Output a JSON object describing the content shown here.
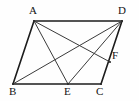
{
  "figure": {
    "kind": "geometry-diagram",
    "shape_name": "parallelogram",
    "canvas": {
      "width": 139,
      "height": 101,
      "background": "#fefefe"
    },
    "stroke_color": "#2b2b2b",
    "label_color": "#141414",
    "points": [
      {
        "id": "A",
        "label": "A",
        "x": 34,
        "y": 21,
        "label_x": 29,
        "label_y": 5,
        "role": "vertex"
      },
      {
        "id": "D",
        "label": "D",
        "x": 122,
        "y": 21,
        "label_x": 118,
        "label_y": 5,
        "role": "vertex"
      },
      {
        "id": "B",
        "label": "B",
        "x": 13,
        "y": 84,
        "label_x": 9,
        "label_y": 86,
        "role": "vertex"
      },
      {
        "id": "C",
        "label": "C",
        "x": 101,
        "y": 84,
        "label_x": 96,
        "label_y": 86,
        "role": "vertex"
      },
      {
        "id": "E",
        "label": "E",
        "x": 68,
        "y": 84,
        "label_x": 64,
        "label_y": 86,
        "role": "point-on-BC"
      },
      {
        "id": "F",
        "label": "F",
        "x": 110,
        "y": 62,
        "label_x": 112,
        "label_y": 50,
        "role": "point-on-DC"
      }
    ],
    "segments": [
      {
        "id": "AD",
        "from": "A",
        "to": "D",
        "weight": "heavy",
        "kind": "side"
      },
      {
        "id": "AB",
        "from": "A",
        "to": "B",
        "weight": "heavy",
        "kind": "side"
      },
      {
        "id": "BC",
        "from": "B",
        "to": "C",
        "weight": "heavy",
        "kind": "side"
      },
      {
        "id": "DC",
        "from": "D",
        "to": "C",
        "weight": "heavy",
        "kind": "side"
      },
      {
        "id": "AE",
        "from": "A",
        "to": "E",
        "weight": "thin",
        "kind": "cevian"
      },
      {
        "id": "AF",
        "from": "A",
        "to": "F",
        "weight": "thin",
        "kind": "cevian"
      },
      {
        "id": "BD",
        "from": "B",
        "to": "D",
        "weight": "thin",
        "kind": "diagonal"
      },
      {
        "id": "ED",
        "from": "E",
        "to": "D",
        "weight": "thin",
        "kind": "cevian"
      }
    ]
  }
}
